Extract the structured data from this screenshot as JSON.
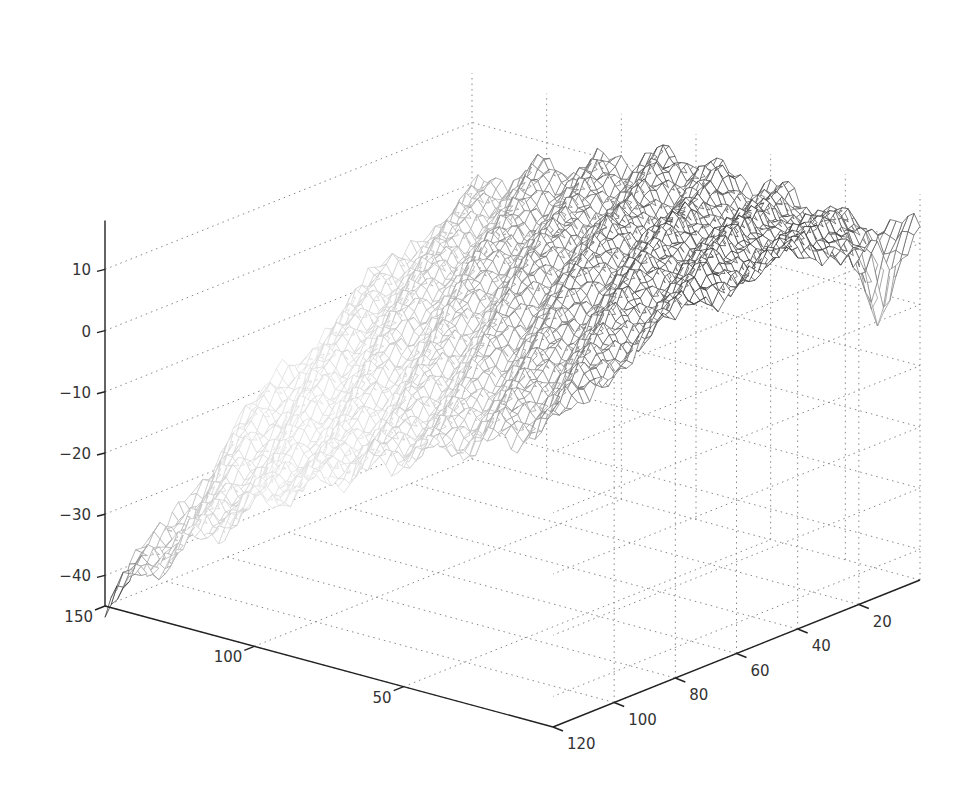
{
  "chart_data": {
    "type": "surface",
    "style": "mesh",
    "colormap": "gray",
    "title": "",
    "xlabel": "",
    "ylabel": "",
    "zlabel": "",
    "grid": true,
    "box": false,
    "xlim": [
      0,
      150
    ],
    "ylim": [
      0,
      120
    ],
    "zlim": [
      -45,
      18
    ],
    "x_ticks": [
      50,
      100,
      150
    ],
    "y_ticks": [
      20,
      40,
      60,
      80,
      100,
      120
    ],
    "z_ticks": [
      -40,
      -30,
      -20,
      -10,
      0,
      10
    ],
    "x_tick_labels": [
      "50",
      "100",
      "150"
    ],
    "y_tick_labels": [
      "20",
      "40",
      "60",
      "80",
      "100",
      "120"
    ],
    "z_tick_labels": [
      "-40",
      "-30",
      "-20",
      "-10",
      "0",
      "10"
    ],
    "surface_description": "Rough terrain-like surface rising from about -45 at (x=150,y=120) to a ridge near +15 at low x; dip near y≈10 at x≈0",
    "surface_samples": {
      "x": [
        0,
        25,
        50,
        75,
        100,
        125,
        150
      ],
      "y": [
        0,
        20,
        40,
        60,
        80,
        100,
        120
      ],
      "z": [
        [
          12,
          10,
          12,
          14,
          10,
          6,
          -2
        ],
        [
          14,
          14,
          12,
          10,
          6,
          0,
          -6
        ],
        [
          16,
          15,
          13,
          9,
          3,
          -4,
          -12
        ],
        [
          16,
          14,
          10,
          4,
          -3,
          -10,
          -18
        ],
        [
          14,
          10,
          4,
          -3,
          -10,
          -18,
          -26
        ],
        [
          10,
          4,
          -3,
          -10,
          -18,
          -27,
          -36
        ],
        [
          4,
          -2,
          -8,
          -14,
          -22,
          -32,
          -45
        ]
      ]
    }
  }
}
